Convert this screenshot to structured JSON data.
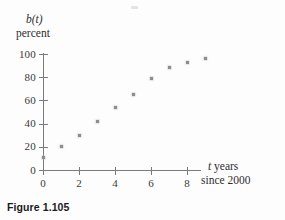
{
  "figure": {
    "caption": "Figure 1.105"
  },
  "chart_data": {
    "type": "scatter",
    "title": "",
    "subtitle": "",
    "xlabel": "t years since 2000",
    "ylabel": "b(t) percent",
    "y_axis_title_lines": [
      "b(t)",
      "percent"
    ],
    "x_axis_title_lines": [
      "t years",
      "since 2000"
    ],
    "y_axis_function_name": "b(t)",
    "y_axis_unit": "percent",
    "x_axis_variable": "t",
    "x_axis_unit_words": "years",
    "x_axis_epoch": "since 2000",
    "x": [
      0,
      1,
      2,
      3,
      4,
      5,
      6,
      7,
      8,
      9
    ],
    "values": [
      11,
      20,
      30,
      42,
      54,
      65,
      79,
      88,
      93,
      96
    ],
    "xlim": [
      0,
      9.8
    ],
    "ylim": [
      0,
      103
    ],
    "xticks": [
      0,
      2,
      4,
      6,
      8
    ],
    "xtick_labels": [
      "0",
      "2",
      "4",
      "6",
      "8"
    ],
    "yticks": [
      0,
      20,
      40,
      60,
      80,
      100
    ],
    "ytick_labels": [
      "0",
      "20",
      "40",
      "60",
      "80",
      "100"
    ],
    "grid": false,
    "legend": false,
    "legend_position": "none",
    "marker": "square",
    "marker_color": "#8d8d8d",
    "axis_color": "#7b7b7b",
    "background_color": "#fdfdfd"
  }
}
